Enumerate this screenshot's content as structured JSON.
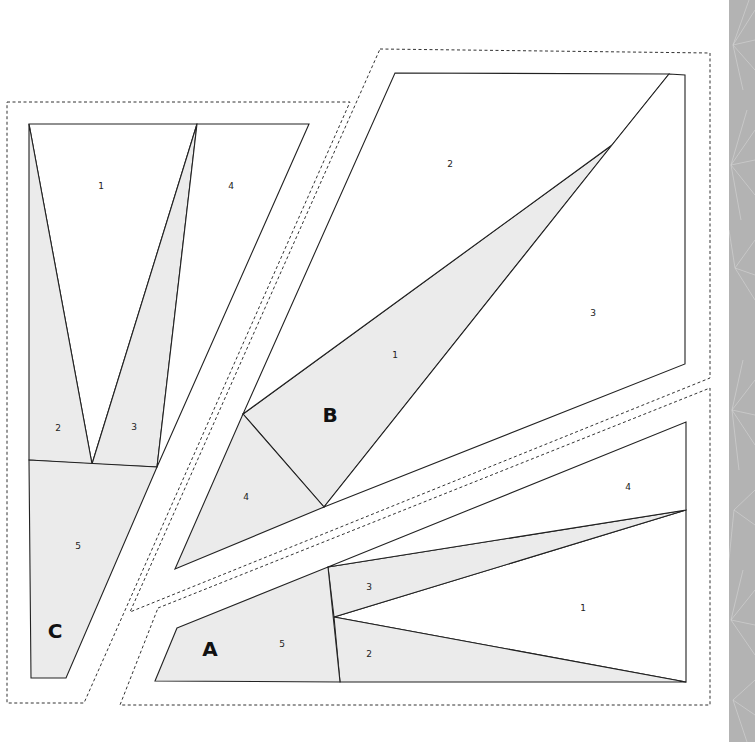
{
  "colors": {
    "shaded": "#ebebeb",
    "plain": "#ffffff",
    "line": "#222222",
    "strip": "#b3b3b3"
  },
  "sections": [
    {
      "id": "C",
      "label": "C",
      "label_pos": [
        55,
        632
      ],
      "seam": [
        [
          7,
          102
        ],
        [
          350,
          102
        ],
        [
          84,
          703
        ],
        [
          7,
          703
        ]
      ],
      "pieces": [
        {
          "num": "1",
          "fill": "plain",
          "points": [
            [
              29,
              124
            ],
            [
              197,
              124
            ],
            [
              92,
              464
            ]
          ],
          "label_pos": [
            101,
            186
          ]
        },
        {
          "num": "2",
          "fill": "shaded",
          "points": [
            [
              29,
              124
            ],
            [
              92,
              464
            ],
            [
              29,
              460
            ]
          ],
          "label_pos": [
            58,
            428
          ]
        },
        {
          "num": "3",
          "fill": "shaded",
          "points": [
            [
              197,
              124
            ],
            [
              157,
              467
            ],
            [
              92,
              464
            ]
          ],
          "label_pos": [
            134,
            427
          ]
        },
        {
          "num": "4",
          "fill": "plain",
          "points": [
            [
              197,
              124
            ],
            [
              309,
              124
            ],
            [
              157,
              467
            ]
          ],
          "label_pos": [
            231,
            186
          ]
        },
        {
          "num": "5",
          "fill": "shaded",
          "points": [
            [
              29,
              460
            ],
            [
              157,
              467
            ],
            [
              66,
              678
            ],
            [
              31,
              678
            ]
          ],
          "label_pos": [
            78,
            546
          ]
        }
      ]
    },
    {
      "id": "B",
      "label": "B",
      "label_pos": [
        330,
        416
      ],
      "seam": [
        [
          380,
          49
        ],
        [
          710,
          53
        ],
        [
          710,
          378
        ],
        [
          130,
          612
        ]
      ],
      "pieces": [
        {
          "num": "1",
          "fill": "shaded",
          "points": [
            [
              243,
              414
            ],
            [
              612,
              145
            ],
            [
              324,
              507
            ]
          ],
          "label_pos": [
            395,
            355
          ]
        },
        {
          "num": "2",
          "fill": "plain",
          "points": [
            [
              395,
              73
            ],
            [
              669,
              74
            ],
            [
              612,
              145
            ],
            [
              243,
              414
            ]
          ],
          "label_pos": [
            450,
            164
          ]
        },
        {
          "num": "3",
          "fill": "plain",
          "points": [
            [
              669,
              74
            ],
            [
              685,
              75
            ],
            [
              685,
              364
            ],
            [
              324,
              507
            ],
            [
              612,
              145
            ]
          ],
          "label_pos": [
            593,
            313
          ]
        },
        {
          "num": "4",
          "fill": "shaded",
          "points": [
            [
              243,
              414
            ],
            [
              324,
              507
            ],
            [
              175,
              569
            ]
          ],
          "label_pos": [
            246,
            497
          ]
        }
      ]
    },
    {
      "id": "A",
      "label": "A",
      "label_pos": [
        210,
        650
      ],
      "seam": [
        [
          158,
          608
        ],
        [
          710,
          388
        ],
        [
          710,
          705
        ],
        [
          120,
          705
        ]
      ],
      "pieces": [
        {
          "num": "1",
          "fill": "plain",
          "points": [
            [
              334,
              617
            ],
            [
              686,
              510
            ],
            [
              686,
              682
            ]
          ],
          "label_pos": [
            583,
            608
          ]
        },
        {
          "num": "2",
          "fill": "shaded",
          "points": [
            [
              334,
              617
            ],
            [
              686,
              682
            ],
            [
              340,
              682
            ]
          ],
          "label_pos": [
            369,
            654
          ]
        },
        {
          "num": "3",
          "fill": "shaded",
          "points": [
            [
              328,
              567
            ],
            [
              686,
              510
            ],
            [
              334,
              617
            ]
          ],
          "label_pos": [
            369,
            587
          ]
        },
        {
          "num": "4",
          "fill": "plain",
          "points": [
            [
              328,
              567
            ],
            [
              686,
              422
            ],
            [
              686,
              510
            ]
          ],
          "label_pos": [
            628,
            487
          ]
        },
        {
          "num": "5",
          "fill": "shaded",
          "points": [
            [
              177,
              628
            ],
            [
              328,
              567
            ],
            [
              340,
              682
            ],
            [
              155,
              681
            ]
          ],
          "label_pos": [
            282,
            644
          ]
        }
      ]
    }
  ]
}
